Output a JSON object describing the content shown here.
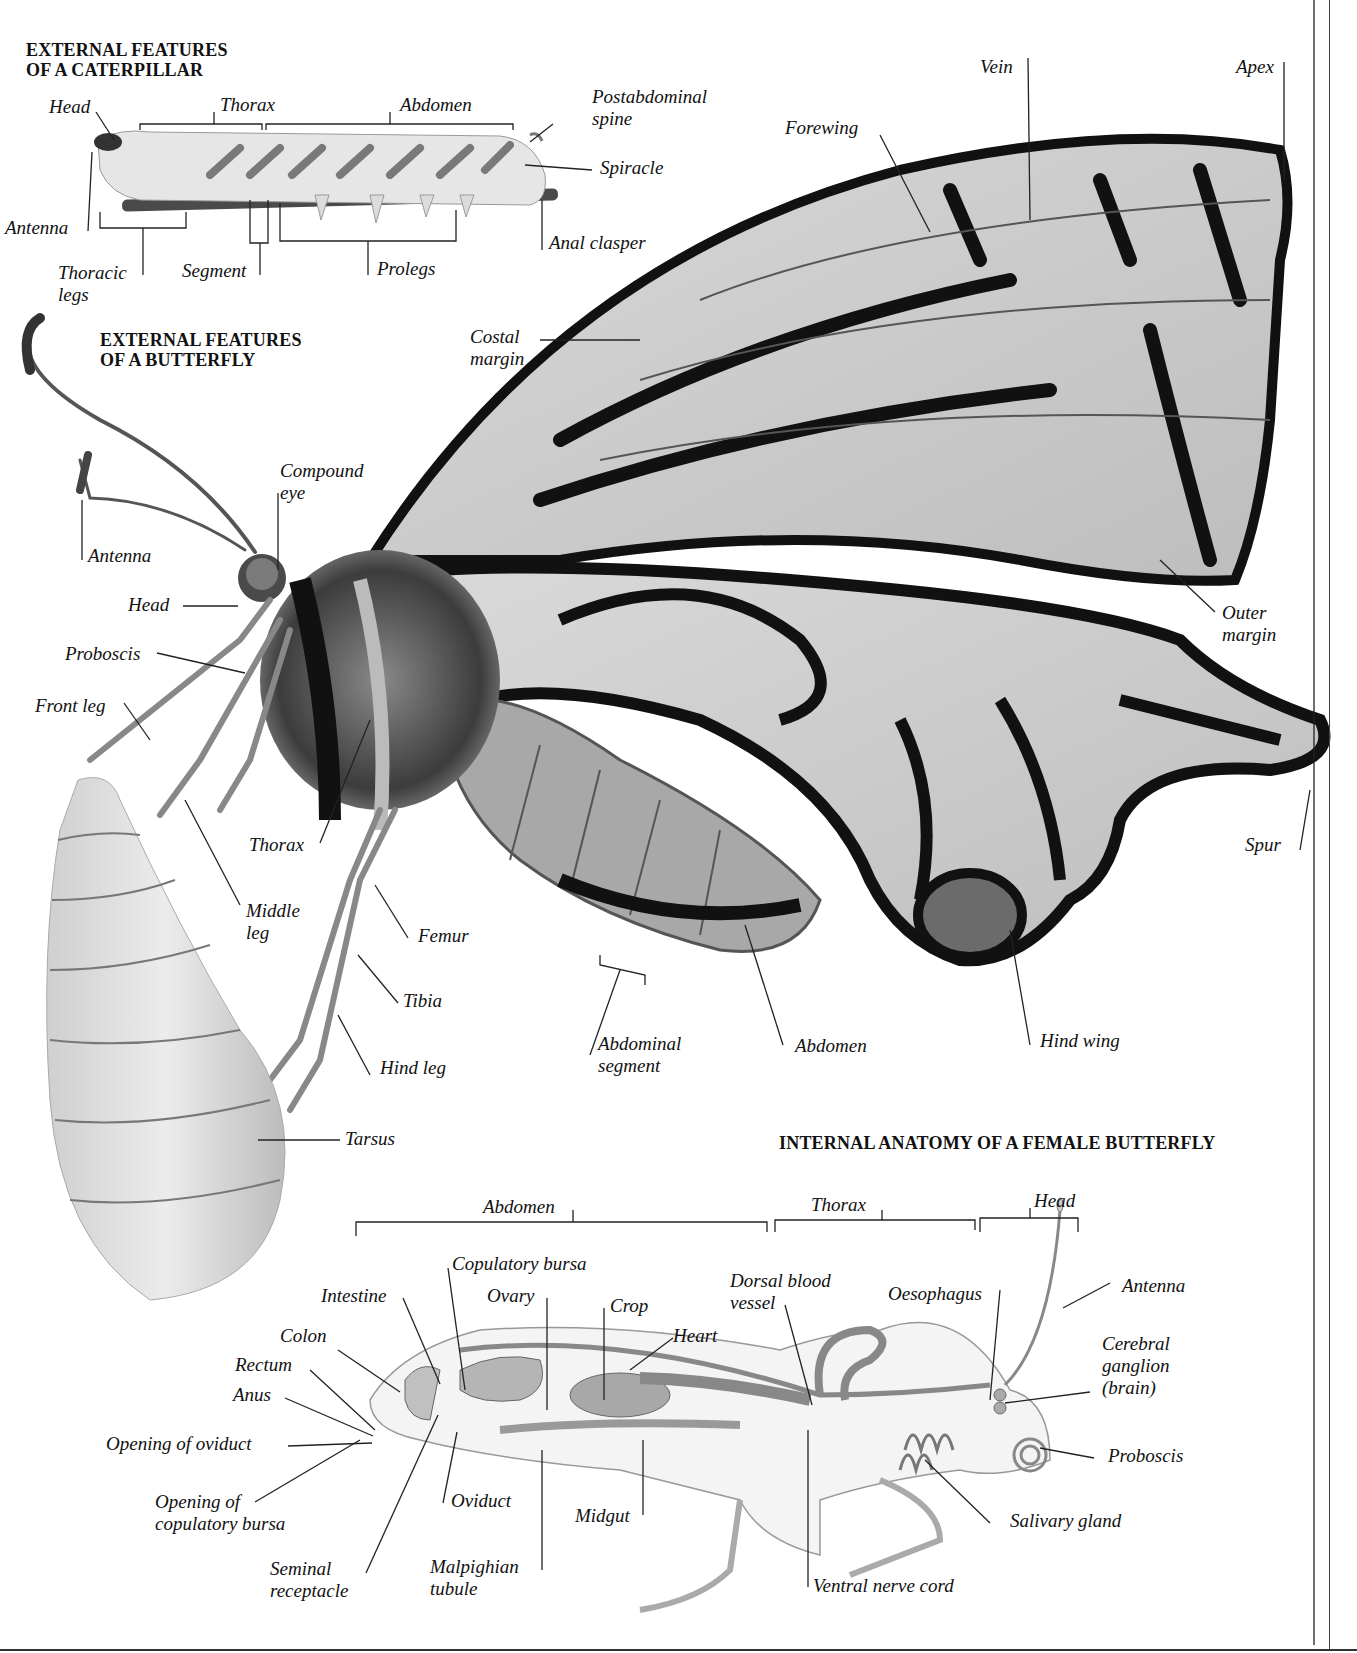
{
  "headings": {
    "caterpillar": "EXTERNAL FEATURES\nOF A CATERPILLAR",
    "butterfly": "EXTERNAL FEATURES\nOF A BUTTERFLY",
    "internal": "INTERNAL ANATOMY OF A FEMALE BUTTERFLY"
  },
  "caterpillar_labels": {
    "head": "Head",
    "thorax": "Thorax",
    "abdomen": "Abdomen",
    "postabdominal_spine": "Postabdominal\nspine",
    "spiracle": "Spiracle",
    "antenna": "Antenna",
    "thoracic_legs": "Thoracic\nlegs",
    "segment": "Segment",
    "prolegs": "Prolegs",
    "anal_clasper": "Anal clasper"
  },
  "butterfly_labels": {
    "vein": "Vein",
    "apex": "Apex",
    "forewing": "Forewing",
    "costal_margin": "Costal\nmargin",
    "compound_eye": "Compound\neye",
    "antenna": "Antenna",
    "head": "Head",
    "proboscis": "Proboscis",
    "front_leg": "Front leg",
    "outer_margin": "Outer\nmargin",
    "thorax": "Thorax",
    "spur": "Spur",
    "middle_leg": "Middle\nleg",
    "femur": "Femur",
    "tibia": "Tibia",
    "hind_leg": "Hind leg",
    "abdominal_segment": "Abdominal\nsegment",
    "abdomen": "Abdomen",
    "hind_wing": "Hind wing",
    "tarsus": "Tarsus"
  },
  "internal_labels": {
    "abdomen": "Abdomen",
    "thorax": "Thorax",
    "head": "Head",
    "copulatory_bursa": "Copulatory bursa",
    "intestine": "Intestine",
    "ovary": "Ovary",
    "crop": "Crop",
    "dorsal_blood_vessel": "Dorsal blood\nvessel",
    "oesophagus": "Oesophagus",
    "antenna": "Antenna",
    "colon": "Colon",
    "heart": "Heart",
    "cerebral_ganglion": "Cerebral\nganglion\n(brain)",
    "rectum": "Rectum",
    "anus": "Anus",
    "opening_of_oviduct": "Opening of oviduct",
    "proboscis": "Proboscis",
    "opening_of_copulatory_bursa": "Opening of\ncopulatory bursa",
    "oviduct": "Oviduct",
    "midgut": "Midgut",
    "salivary_gland": "Salivary gland",
    "seminal_receptacle": "Seminal\nreceptacle",
    "malpighian_tubule": "Malpighian\ntubule",
    "ventral_nerve_cord": "Ventral nerve cord"
  }
}
